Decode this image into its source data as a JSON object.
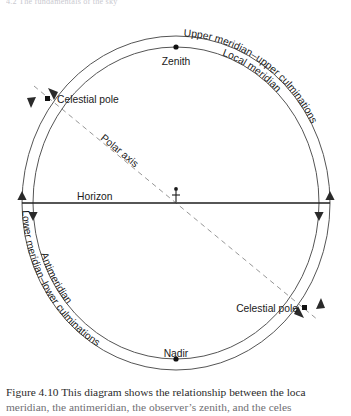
{
  "top_fragment": "4.2  The fundamentals of the sky",
  "figure": {
    "labels": {
      "zenith": "Zenith",
      "nadir": "Nadir",
      "horizon": "Horizon",
      "polar_axis": "Polar axis",
      "celestial_pole_upper": "Celestial pole",
      "celestial_pole_lower": "Celestial pole",
      "local_meridian": "Local meridian",
      "antimeridian": "Antimeridian",
      "upper_meridian": "Upper meridian–upper culminations",
      "lower_meridian": "Lower meridian–lower culminations"
    },
    "markers": {
      "zenith": "dot-marker",
      "nadir": "dot-marker",
      "celestial_pole_upper": "square-marker",
      "celestial_pole_lower": "square-marker",
      "observer": "observer-figure"
    },
    "colors": {
      "line": "#4a4a4a",
      "horizon": "#222222",
      "dashed_axis": "#7a7a7a",
      "text": "#1a1a1a"
    }
  },
  "caption": {
    "figure_number": "Figure 4.10",
    "line1": "Figure 4.10  This diagram shows the relationship between the loca",
    "line2": "meridian, the antimeridian, the observer’s zenith, and the celes"
  }
}
